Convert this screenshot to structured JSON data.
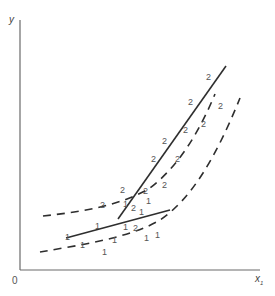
{
  "figure": {
    "type": "scatter-with-boundaries",
    "axes": {
      "y_label": "y",
      "x_label": "x",
      "x_label_subscript": "1",
      "origin_label": "0"
    },
    "class_labels": [
      "1",
      "2"
    ],
    "points_class_2": [
      {
        "x": 206,
        "y": 78,
        "label": "2"
      },
      {
        "x": 190,
        "y": 101,
        "label": "2"
      },
      {
        "x": 220,
        "y": 108,
        "label": "2"
      },
      {
        "x": 185,
        "y": 128,
        "label": "2"
      },
      {
        "x": 203,
        "y": 129,
        "label": "2"
      },
      {
        "x": 163,
        "y": 141,
        "label": "2"
      },
      {
        "x": 176,
        "y": 158,
        "label": "2"
      },
      {
        "x": 152,
        "y": 160,
        "label": "2"
      },
      {
        "x": 121,
        "y": 193,
        "label": "2"
      },
      {
        "x": 144,
        "y": 193,
        "label": "2"
      },
      {
        "x": 163,
        "y": 186,
        "label": "2"
      },
      {
        "x": 101,
        "y": 209,
        "label": "2"
      },
      {
        "x": 132,
        "y": 208,
        "label": "2"
      },
      {
        "x": 131,
        "y": 220,
        "label": "2"
      }
    ],
    "points_class_1": [
      {
        "x": 138,
        "y": 202,
        "label": "1"
      },
      {
        "x": 146,
        "y": 212,
        "label": "1"
      },
      {
        "x": 145,
        "y": 223,
        "label": "1"
      },
      {
        "x": 124,
        "y": 223,
        "label": "1"
      },
      {
        "x": 95,
        "y": 229,
        "label": "1"
      },
      {
        "x": 65,
        "y": 239,
        "label": "1"
      },
      {
        "x": 112,
        "y": 241,
        "label": "1"
      },
      {
        "x": 143,
        "y": 242,
        "label": "1"
      },
      {
        "x": 79,
        "y": 247,
        "label": "1"
      },
      {
        "x": 158,
        "y": 238,
        "label": "1"
      },
      {
        "x": 145,
        "y": 238,
        "label": "1"
      },
      {
        "x": 103,
        "y": 254,
        "label": "1"
      }
    ],
    "boundaries": [
      {
        "name": "solid-line-class-2",
        "style": "solid"
      },
      {
        "name": "solid-line-class-1",
        "style": "solid"
      },
      {
        "name": "dashed-curve-upper",
        "style": "dashed"
      },
      {
        "name": "dashed-curve-lower",
        "style": "dashed"
      }
    ]
  }
}
